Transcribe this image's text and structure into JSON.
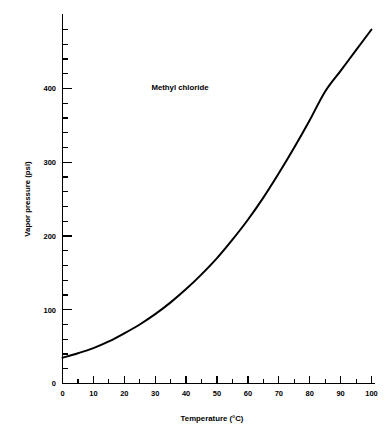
{
  "chart_data": {
    "type": "line",
    "title": "",
    "annotation": "Methyl chloride",
    "xlabel": "Temperature (°C)",
    "ylabel": "Vapor pressure (psi)",
    "xlim": [
      0,
      100
    ],
    "ylim": [
      0,
      480
    ],
    "grid": false,
    "legend": null,
    "xticks": [
      0,
      10,
      20,
      30,
      40,
      50,
      60,
      70,
      80,
      90,
      100
    ],
    "xtick_labels": [
      "0",
      "10",
      "20",
      "30",
      "40",
      "50",
      "60",
      "70",
      "80",
      "90",
      "100"
    ],
    "x_minor_tick_interval": 5,
    "yticks": [
      0,
      100,
      200,
      300,
      400
    ],
    "ytick_labels": [
      "0",
      "100",
      "200",
      "300",
      "400"
    ],
    "y_minor_tick_interval": 20,
    "series": [
      {
        "name": "Methyl chloride",
        "color": "#000000",
        "x": [
          0,
          5,
          10,
          15,
          20,
          25,
          30,
          35,
          40,
          45,
          50,
          55,
          60,
          65,
          70,
          75,
          80,
          85,
          90,
          95,
          100
        ],
        "values": [
          35,
          41,
          48,
          57,
          68,
          80,
          94,
          110,
          128,
          148,
          170,
          195,
          222,
          252,
          285,
          320,
          357,
          396,
          424,
          452,
          480
        ]
      }
    ]
  },
  "figure": {
    "background_color": "#ffffff",
    "foreground_color": "#000000"
  }
}
